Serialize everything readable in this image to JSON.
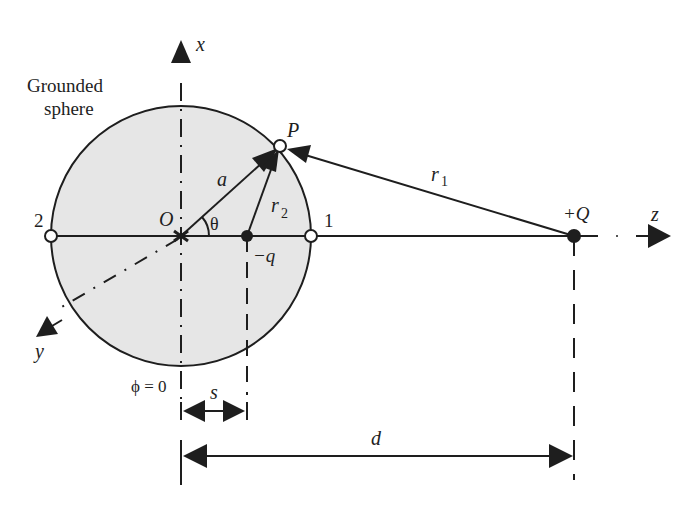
{
  "figure": {
    "title_label": "Grounded sphere",
    "title_line1": "Grounded",
    "title_line2": "sphere",
    "colors": {
      "sphere_fill": "#e6e6e6",
      "stroke": "#1e1e1e",
      "background": "#ffffff"
    }
  },
  "axes": {
    "x_label": "x",
    "y_label": "y",
    "z_label": "z"
  },
  "points": {
    "origin_label": "O",
    "point_p_label": "P",
    "point_1_label": "1",
    "point_2_label": "2",
    "image_charge_label": "−q",
    "source_charge_label": "+Q"
  },
  "vectors": {
    "radius_label": "a",
    "r1_label": "r",
    "r1_sub": "1",
    "r2_label": "r",
    "r2_sub": "2",
    "angle_label": "θ"
  },
  "annotations": {
    "phi_label": "ϕ = 0",
    "s_label": "s",
    "d_label": "d"
  }
}
